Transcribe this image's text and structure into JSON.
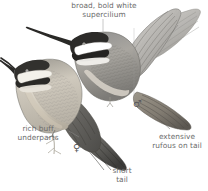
{
  "plate": {
    "kind": "bird-field-guide-illustration",
    "subject": "hummingbird",
    "background_color": "#ffffff",
    "ink_color": "#4a4a4a",
    "label_color": "#6b6b6b",
    "buff_color": "#cfc3ae",
    "rufous_color": "#b2a38d"
  },
  "annotations": {
    "supercilium": "broad, bold white\nsupercilium",
    "underparts": "rich buff\nunderparts",
    "short_tail": "short\ntail",
    "rufous_tail": "extensive\nrufous on tail"
  },
  "symbols": {
    "male": "♂",
    "female": "♀"
  },
  "figures": [
    {
      "name": "female-perched-bird",
      "sex": "female",
      "pose": "perched, facing left",
      "labels": [
        "rich buff underparts",
        "short tail"
      ]
    },
    {
      "name": "male-hovering-bird",
      "sex": "male",
      "pose": "hovering, wings raised, facing left",
      "labels": [
        "broad, bold white supercilium",
        "extensive rufous on tail"
      ]
    }
  ]
}
